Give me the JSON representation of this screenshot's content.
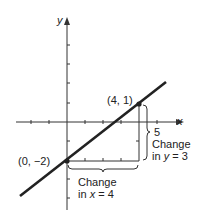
{
  "diagram": {
    "type": "coordinate-plane-line",
    "axes": {
      "x_label": "x",
      "y_label": "y",
      "x_tick_label": "5"
    },
    "points": [
      {
        "label": "(4, 1)",
        "x": 4,
        "y": 1
      },
      {
        "label": "(0, −2)",
        "x": 0,
        "y": -2
      }
    ],
    "annotations": {
      "change_y_line1": "Change",
      "change_y_prefix": "in ",
      "change_y_var": "y",
      "change_y_suffix": " = 3",
      "change_x_line1": "Change",
      "change_x_prefix": "in ",
      "change_x_var": "x",
      "change_x_suffix": " = 4"
    },
    "colors": {
      "line": "#222222",
      "axis": "#333333",
      "background": "#ffffff"
    }
  }
}
